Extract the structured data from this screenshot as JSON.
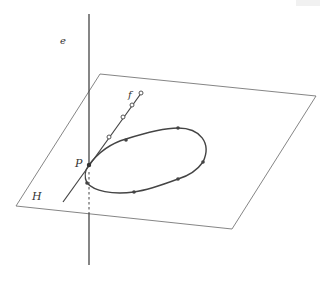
{
  "diagram": {
    "title": "",
    "labels": {
      "line_e": "e",
      "line_f": "f",
      "point_P": "P",
      "plane_H": "H"
    },
    "colors": {
      "stroke": "#444444",
      "plane_stroke": "#777777",
      "background": "#ffffff"
    },
    "plane_H": {
      "corners": [
        [
          100,
          74
        ],
        [
          316,
          96
        ],
        [
          232,
          229
        ],
        [
          16,
          206
        ]
      ]
    },
    "line_e": {
      "x": 89,
      "y_top": 14,
      "y_bottom": 265,
      "dashed_from": 176,
      "dashed_to": 213
    },
    "line_f": {
      "from": [
        63,
        202
      ],
      "to": [
        142,
        92
      ],
      "open_points": [
        [
          109,
          137
        ],
        [
          123,
          117
        ],
        [
          132,
          105
        ],
        [
          141,
          93
        ]
      ]
    },
    "ellipse": {
      "cx": 146,
      "cy": 160,
      "rx": 62,
      "ry": 28,
      "rotation": -18,
      "points": [
        [
          126,
          140
        ],
        [
          178,
          128
        ],
        [
          203,
          162
        ],
        [
          178,
          179
        ],
        [
          134,
          192
        ],
        [
          87,
          183
        ]
      ]
    },
    "point_P": [
      89,
      165
    ]
  }
}
